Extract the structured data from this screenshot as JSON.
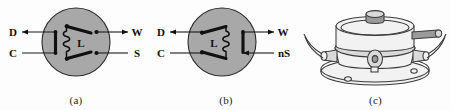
{
  "figure": {
    "background_color": "#fdfdfd",
    "disc_color": "#a8a8a8",
    "ink_color": "#101010",
    "panels": [
      {
        "id": "a",
        "caption": "(a)",
        "inner_label": "L",
        "left_labels": [
          "D",
          "C"
        ],
        "right_labels": [
          "W",
          "S"
        ],
        "arrow_on": [
          "D",
          "W"
        ],
        "plain_on": [
          "C",
          "S"
        ]
      },
      {
        "id": "b",
        "caption": "(b)",
        "inner_label": "L",
        "left_labels": [
          "D",
          "C"
        ],
        "right_labels": [
          "W",
          "nS"
        ],
        "arrow_on": [
          "D",
          "W"
        ],
        "plain_on": [
          "C",
          "nS"
        ]
      },
      {
        "id": "c",
        "caption": "(c)",
        "inner_label": "",
        "left_labels": [],
        "right_labels": [],
        "arrow_on": [],
        "plain_on": []
      }
    ]
  },
  "panel_a": {
    "caption": "(a)",
    "label_D": "D",
    "label_C": "C",
    "label_W": "W",
    "label_S": "S",
    "label_L": "L"
  },
  "panel_b": {
    "caption": "(b)",
    "label_D": "D",
    "label_C": "C",
    "label_W": "W",
    "label_nS": "nS",
    "label_L": "L"
  },
  "panel_c": {
    "caption": "(c)"
  }
}
